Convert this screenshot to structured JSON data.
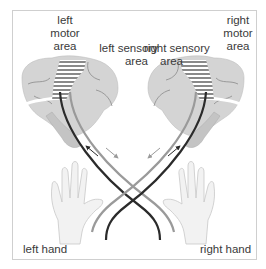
{
  "diagram": {
    "type": "neuroanatomy-illustration",
    "labels": {
      "left_motor_area": [
        "left",
        "motor",
        "area"
      ],
      "right_motor_area": [
        "right",
        "motor",
        "area"
      ],
      "left_sensory_area": [
        "left sensory",
        "area"
      ],
      "right_sensory_area": [
        "right sensory",
        "area"
      ],
      "left_hand": "left hand",
      "right_hand": "right hand"
    },
    "colors": {
      "brain_fill": "#d4d4d4",
      "brain_lines": "#8a8a8a",
      "motor_pathway": "#2b2b2b",
      "sensory_pathway": "#9a9a9a",
      "hand_fill": "#f2f2f2",
      "frame_border": "#cfcfcf",
      "text": "#3a3a3a"
    },
    "pathways": [
      {
        "name": "left-motor-to-right-hand",
        "color": "dark",
        "arrow_direction": "down-right"
      },
      {
        "name": "right-hand-to-left-sensory",
        "color": "light",
        "arrow_direction": "up-left"
      },
      {
        "name": "right-motor-to-left-hand",
        "color": "dark",
        "arrow_direction": "down-left"
      },
      {
        "name": "left-hand-to-right-sensory",
        "color": "light",
        "arrow_direction": "up-right"
      }
    ]
  }
}
